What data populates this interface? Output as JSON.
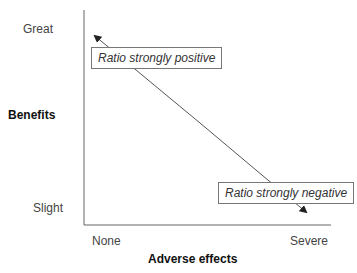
{
  "y_axis": {
    "title": "Benefits",
    "ticks": [
      "Great",
      "Slight"
    ]
  },
  "x_axis": {
    "title": "Adverse effects",
    "ticks": [
      "None",
      "Severe"
    ]
  },
  "annotations": {
    "top_left": "Ratio strongly positive",
    "bottom_right": "Ratio strongly negative"
  },
  "colors": {
    "axis": "#666666",
    "arrow": "#555555",
    "text": "#333333"
  }
}
